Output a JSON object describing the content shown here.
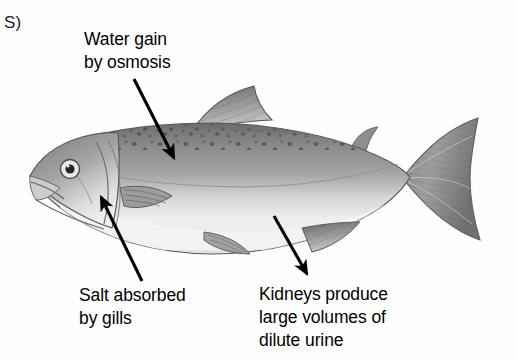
{
  "figure": {
    "panel_letter": "S)",
    "background_color": "#fefefe",
    "ink_color": "#000000",
    "width": 516,
    "height": 361
  },
  "illustration": {
    "name": "pencil-drawing-of-trout",
    "description": "grayscale pencil illustration of a spotted trout facing left",
    "body_tone": "#9b9b9b",
    "belly_tone": "#f0f0f0",
    "spot_tone": "#4a4a4a",
    "parts": [
      "head",
      "eye",
      "gill-cover",
      "pectoral-fin",
      "pelvic-fin",
      "dorsal-fin",
      "adipose-fin",
      "anal-fin",
      "caudal-fin",
      "lateral-line"
    ]
  },
  "callouts": [
    {
      "id": "water",
      "text": "Water gain\nby osmosis",
      "lines": [
        "Water gain",
        "by osmosis"
      ],
      "arrow": {
        "from": [
          134,
          79
        ],
        "to": [
          174,
          158
        ],
        "direction": "down-right",
        "points_at": "fish-back-upper-body"
      }
    },
    {
      "id": "salt",
      "text": "Salt absorbed\nby gills",
      "lines": [
        "Salt absorbed",
        "by gills"
      ],
      "arrow": {
        "from": [
          142,
          281
        ],
        "to": [
          101,
          197
        ],
        "direction": "up-left",
        "points_at": "gill-cover"
      }
    },
    {
      "id": "kidneys",
      "text": "Kidneys produce\nlarge volumes of\ndilute urine",
      "lines": [
        "Kidneys produce",
        "large volumes of",
        "dilute urine"
      ],
      "arrow": {
        "from": [
          274,
          216
        ],
        "to": [
          307,
          274
        ],
        "direction": "down-right",
        "points_at": "fish-belly-vent-region"
      }
    }
  ]
}
